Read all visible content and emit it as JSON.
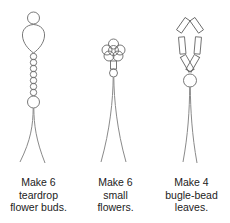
{
  "figures": [
    {
      "id": "teardrop-flower-bud",
      "caption_lines": [
        "Make 6",
        "teardrop",
        "flower buds."
      ],
      "quantity": 6
    },
    {
      "id": "small-flower",
      "caption_lines": [
        "Make 6",
        "small",
        "flowers."
      ],
      "quantity": 6
    },
    {
      "id": "bugle-bead-leaf",
      "caption_lines": [
        "Make 4",
        "bugle-bead",
        "leaves."
      ],
      "quantity": 4
    }
  ],
  "colors": {
    "line": "#6a6a6a",
    "wire": "#8a8a8a",
    "text": "#222222",
    "background": "#ffffff"
  }
}
